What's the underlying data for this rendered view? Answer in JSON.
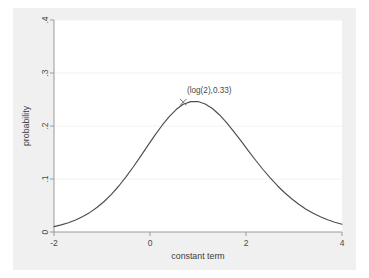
{
  "chart_data": {
    "type": "line",
    "title": "",
    "subtitle": "",
    "xlabel": "constant term",
    "ylabel": "probability",
    "xlim": [
      -2,
      4
    ],
    "ylim": [
      0,
      0.4
    ],
    "xticks": [
      -2,
      0,
      2,
      4
    ],
    "xtick_labels": [
      "-2",
      "0",
      "2",
      "4"
    ],
    "yticks": [
      0,
      0.1,
      0.2,
      0.3,
      0.4
    ],
    "ytick_labels": [
      "0",
      ".1",
      ".2",
      ".3",
      ".4"
    ],
    "grid": "horizontal",
    "legend": "none",
    "series": [
      {
        "name": "probability density",
        "color": "#4d4d4d",
        "x": [
          -2.0,
          -1.85,
          -1.7,
          -1.55,
          -1.4,
          -1.25,
          -1.1,
          -0.95,
          -0.8,
          -0.65,
          -0.5,
          -0.35,
          -0.2,
          -0.05,
          0.1,
          0.25,
          0.4,
          0.55,
          0.693,
          0.85,
          1.0,
          1.15,
          1.3,
          1.45,
          1.6,
          1.75,
          1.9,
          2.05,
          2.2,
          2.35,
          2.5,
          2.65,
          2.8,
          2.95,
          3.1,
          3.25,
          3.4,
          3.55,
          3.7,
          3.85,
          4.0
        ],
        "y": [
          0.0102,
          0.0134,
          0.0175,
          0.0227,
          0.0291,
          0.037,
          0.0466,
          0.058,
          0.0714,
          0.0868,
          0.1039,
          0.1226,
          0.1423,
          0.1625,
          0.1823,
          0.201,
          0.2176,
          0.2315,
          0.2409,
          0.246,
          0.2461,
          0.2416,
          0.233,
          0.2208,
          0.2059,
          0.1891,
          0.1713,
          0.1532,
          0.1354,
          0.1184,
          0.1025,
          0.0878,
          0.0745,
          0.0627,
          0.0522,
          0.0431,
          0.0353,
          0.0287,
          0.0231,
          0.0185,
          0.0147
        ]
      }
    ],
    "annotations": [
      {
        "text": "(log(2),0.33)",
        "marker": "x",
        "x": 0.693,
        "y": 0.33
      }
    ]
  },
  "axes": {
    "y_axis_title": "probability",
    "x_axis_title": "constant term"
  },
  "colors": {
    "figure_background": "#f0f0f0",
    "plot_background": "#ffffff",
    "curve": "#4d4d4d",
    "axis": "#9a9a9a",
    "gridline": "#f2f2f2",
    "text": "#4a4a4a"
  }
}
